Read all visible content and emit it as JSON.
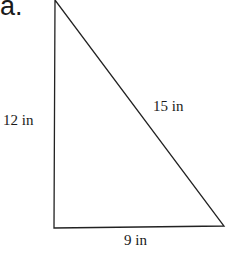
{
  "problem_label": "a.",
  "figure": {
    "type": "right-triangle",
    "sides": {
      "vertical_leg": "12 in",
      "hypotenuse": "15 in",
      "horizontal_leg": "9 in"
    },
    "stroke_color": "#222222"
  }
}
